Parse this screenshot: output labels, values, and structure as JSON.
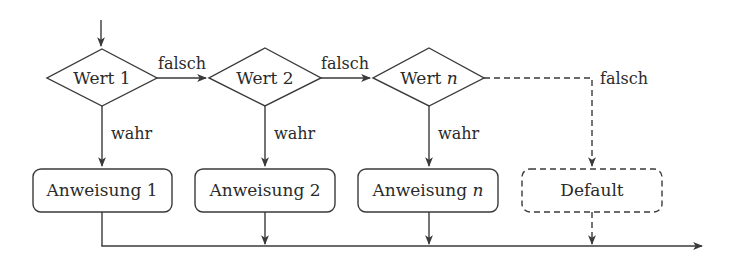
{
  "diagram": {
    "type": "flowchart",
    "title": "",
    "colors": {
      "stroke": "#3a3a3a",
      "text": "#2a2a2a",
      "background": "#ffffff"
    },
    "decisions": [
      {
        "id": "d1",
        "label_main": "Wert 1",
        "label_var": ""
      },
      {
        "id": "d2",
        "label_main": "Wert 2",
        "label_var": ""
      },
      {
        "id": "dn",
        "label_main": "Wert ",
        "label_var": "n"
      }
    ],
    "statements": [
      {
        "id": "s1",
        "label_main": "Anweisung 1",
        "label_var": "",
        "style": "solid"
      },
      {
        "id": "s2",
        "label_main": "Anweisung 2",
        "label_var": "",
        "style": "solid"
      },
      {
        "id": "sn",
        "label_main": "Anweisung ",
        "label_var": "n",
        "style": "solid"
      },
      {
        "id": "default",
        "label_main": "Default",
        "label_var": "",
        "style": "dashed"
      }
    ],
    "edge_labels": {
      "false_1": "falsch",
      "false_2": "falsch",
      "false_n": "falsch",
      "true_1": "wahr",
      "true_2": "wahr",
      "true_n": "wahr"
    },
    "edges": [
      {
        "from": "entry",
        "to": "d1",
        "label": ""
      },
      {
        "from": "d1",
        "to": "d2",
        "label": "falsch"
      },
      {
        "from": "d2",
        "to": "dn",
        "label": "falsch"
      },
      {
        "from": "dn",
        "to": "default",
        "label": "falsch",
        "style": "dashed"
      },
      {
        "from": "d1",
        "to": "s1",
        "label": "wahr"
      },
      {
        "from": "d2",
        "to": "s2",
        "label": "wahr"
      },
      {
        "from": "dn",
        "to": "sn",
        "label": "wahr"
      },
      {
        "from": "s1",
        "to": "exit",
        "label": ""
      },
      {
        "from": "s2",
        "to": "exit",
        "label": ""
      },
      {
        "from": "sn",
        "to": "exit",
        "label": ""
      },
      {
        "from": "default",
        "to": "exit",
        "label": "",
        "style": "dashed"
      }
    ]
  }
}
